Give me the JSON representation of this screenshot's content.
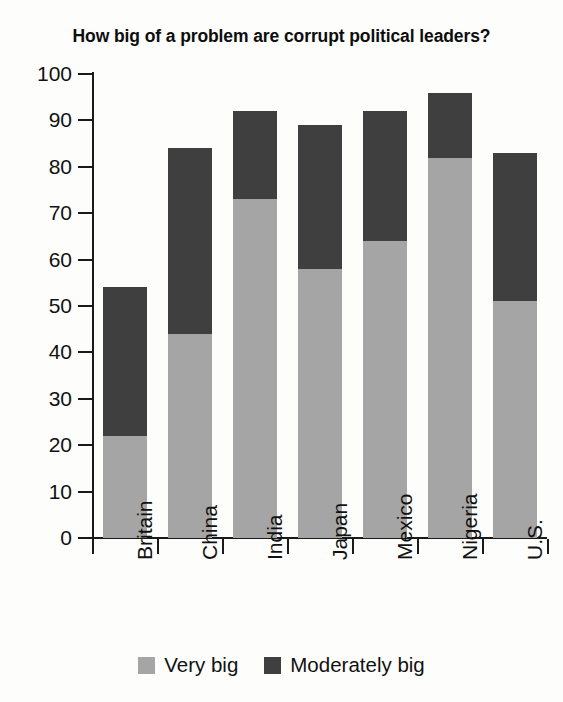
{
  "chart_data": {
    "type": "bar",
    "subtype": "stacked-vertical",
    "title": "How big of a problem are corrupt political leaders?",
    "xlabel": "",
    "ylabel": "",
    "ylim": [
      0,
      100
    ],
    "ytick_step": 10,
    "yticks": [
      100,
      90,
      80,
      70,
      60,
      50,
      40,
      30,
      20,
      10,
      0
    ],
    "grid": false,
    "legend_position": "bottom-center",
    "categories": [
      "Britain",
      "China",
      "India",
      "Japan",
      "Mexico",
      "Nigeria",
      "U.S."
    ],
    "series": [
      {
        "name": "Very big",
        "color": "#a5a5a5",
        "values": [
          22,
          44,
          73,
          58,
          64,
          82,
          51
        ]
      },
      {
        "name": "Moderately big",
        "color": "#3f3f3f",
        "values": [
          32,
          40,
          19,
          31,
          28,
          14,
          32
        ]
      }
    ],
    "totals": [
      54,
      84,
      92,
      89,
      92,
      96,
      83
    ]
  },
  "colors": {
    "very_big": "#a5a5a5",
    "moderately_big": "#3f3f3f",
    "axis": "#1a1a1a",
    "text": "#111111",
    "background": "#fdfdfc"
  }
}
